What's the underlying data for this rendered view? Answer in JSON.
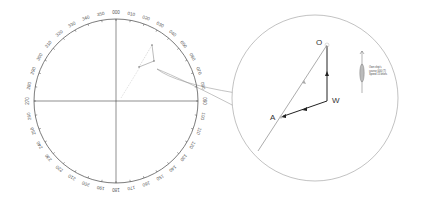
{
  "compass": {
    "center": [
      116,
      101
    ],
    "radius": 82,
    "labels": [
      "000",
      "010",
      "020",
      "030",
      "040",
      "050",
      "060",
      "070",
      "080",
      "090",
      "100",
      "110",
      "120",
      "130",
      "140",
      "150",
      "160",
      "170",
      "180",
      "190",
      "200",
      "210",
      "220",
      "230",
      "240",
      "250",
      "260",
      "270",
      "280",
      "290",
      "300",
      "310",
      "320",
      "330",
      "340",
      "350"
    ]
  },
  "magnifier": {
    "center": [
      315,
      98
    ],
    "radius": 83,
    "points": {
      "O": {
        "label": "O",
        "pos": [
          327,
          45
        ]
      },
      "W": {
        "label": "W",
        "pos": [
          327,
          101
        ]
      },
      "A": {
        "label": "A",
        "pos": [
          281,
          117
        ]
      }
    }
  },
  "own_ship": {
    "line1": "Own ship's",
    "line2": "course 000 (T)",
    "line3": "Speed 15 knots"
  },
  "colors": {
    "line": "#333333",
    "light": "#999999",
    "vector": "#222222"
  }
}
